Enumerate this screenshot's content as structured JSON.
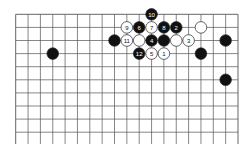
{
  "board": {
    "size": 19,
    "visible_rows": 10,
    "origin": {
      "x": 15.7,
      "y": 14.3
    },
    "spacing": {
      "x": 12.35,
      "y": 13.1
    },
    "line_color": "#555555",
    "black_color": "#111111",
    "white_color": "#ffffff",
    "stone_radius": 5.8
  },
  "stones": [
    {
      "color": "black",
      "col": 11,
      "row": 0,
      "label": "10"
    },
    {
      "color": "white",
      "col": 9,
      "row": 1,
      "label": "9"
    },
    {
      "color": "black",
      "col": 10,
      "row": 1,
      "label": "6"
    },
    {
      "color": "white",
      "col": 11,
      "row": 1,
      "label": "7"
    },
    {
      "color": "black",
      "col": 12,
      "row": 1,
      "label": "8"
    },
    {
      "color": "black",
      "col": 13,
      "row": 1,
      "label": "2"
    },
    {
      "color": "white",
      "col": 15,
      "row": 1,
      "label": ""
    },
    {
      "color": "black",
      "col": 8,
      "row": 2,
      "label": ""
    },
    {
      "color": "white",
      "col": 9,
      "row": 2,
      "label": "11"
    },
    {
      "color": "white",
      "col": 10,
      "row": 2,
      "label": ""
    },
    {
      "color": "black",
      "col": 11,
      "row": 2,
      "label": "4"
    },
    {
      "color": "black",
      "col": 12,
      "row": 2,
      "label": ""
    },
    {
      "color": "white",
      "col": 13,
      "row": 2,
      "label": ""
    },
    {
      "color": "white",
      "col": 14,
      "row": 2,
      "label": "3"
    },
    {
      "color": "black",
      "col": 17,
      "row": 2,
      "label": ""
    },
    {
      "color": "black",
      "col": 3,
      "row": 3,
      "label": ""
    },
    {
      "color": "black",
      "col": 10,
      "row": 3,
      "label": "12"
    },
    {
      "color": "white",
      "col": 11,
      "row": 3,
      "label": "5"
    },
    {
      "color": "white",
      "col": 12,
      "row": 3,
      "label": "1"
    },
    {
      "color": "black",
      "col": 15,
      "row": 3,
      "label": ""
    },
    {
      "color": "black",
      "col": 17,
      "row": 5,
      "label": ""
    }
  ]
}
